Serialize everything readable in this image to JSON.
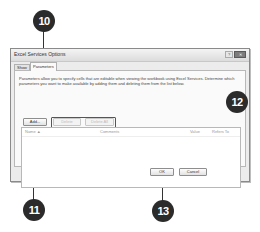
{
  "dialog": {
    "title": "Excel Services Options",
    "help_glyph": "?",
    "close_glyph": "✕",
    "tabs": [
      {
        "label": "Show",
        "active": false
      },
      {
        "label": "Parameters",
        "active": true
      }
    ],
    "description": "Parameters allow you to specify cells that are editable when viewing the workbook using Excel Services. Determine which parameters you want to make available by adding them and deleting them from the list below.",
    "buttons": {
      "add": "Add...",
      "delete": "Delete",
      "delete_all": "Delete All",
      "ok": "OK",
      "cancel": "Cancel"
    },
    "list": {
      "columns": [
        "Name ▲",
        "Comments",
        "Value",
        "Refers To"
      ],
      "rows": []
    }
  },
  "callouts": [
    {
      "number": "10",
      "target": "parameters-tab"
    },
    {
      "number": "11",
      "target": "add-button"
    },
    {
      "number": "12",
      "target": "delete-buttons"
    },
    {
      "number": "13",
      "target": "ok-button"
    }
  ]
}
